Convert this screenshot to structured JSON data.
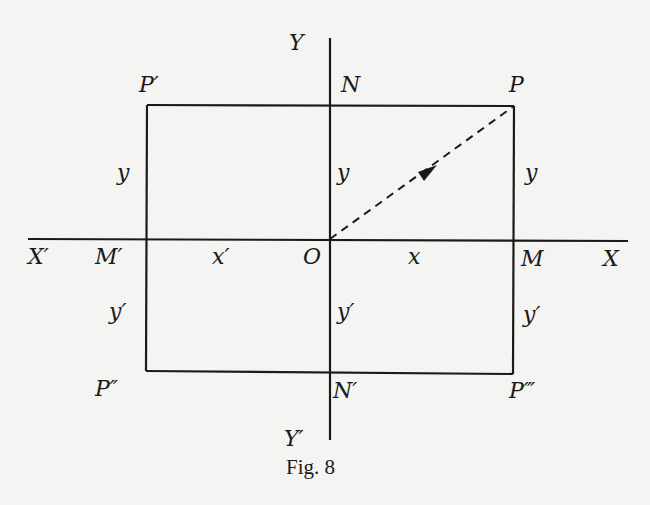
{
  "figure": {
    "caption": "Fig. 8",
    "axes": {
      "x_positive": "X",
      "x_negative": "X′",
      "y_positive": "Y",
      "y_negative": "Y′",
      "origin": "O"
    },
    "points": {
      "P": "P",
      "P1": "P′",
      "P2": "P″",
      "P3": "P‴",
      "M": "M",
      "M1": "M′",
      "N": "N",
      "N1": "N′"
    },
    "segment_labels": {
      "x": "x",
      "x_prime": "x′",
      "y_left": "y",
      "y_center": "y",
      "y_right": "y",
      "y_prime_left": "y′",
      "y_prime_center": "y′",
      "y_prime_right": "y′"
    },
    "vector": {
      "from": "O",
      "to": "P",
      "style": "dashed-arrow"
    },
    "colors": {
      "ink": "#1a1a1a",
      "paper": "#f4f4f2"
    }
  }
}
